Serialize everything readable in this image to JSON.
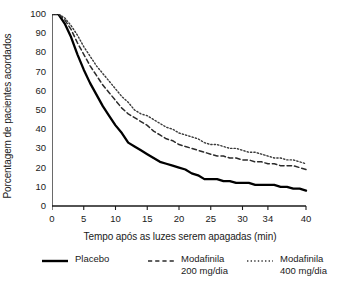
{
  "chart_data": {
    "type": "line",
    "title": "",
    "xlabel": "Tempo após as luzes serem apagadas (min)",
    "ylabel": "Porcentagem de pacientes acordados",
    "xlim": [
      0,
      40
    ],
    "ylim": [
      0,
      100
    ],
    "grid": false,
    "legend_position": "bottom",
    "x_ticks": [
      "0",
      "5",
      "10",
      "15",
      "20",
      "25",
      "30",
      "34",
      "40"
    ],
    "x_tick_values": [
      0,
      5,
      10,
      15,
      20,
      25,
      30,
      34,
      40
    ],
    "y_ticks": [
      "0",
      "10",
      "20",
      "30",
      "40",
      "50",
      "60",
      "70",
      "80",
      "90",
      "100"
    ],
    "y_tick_values": [
      0,
      10,
      20,
      30,
      40,
      50,
      60,
      70,
      80,
      90,
      100
    ],
    "x": [
      0,
      1,
      2,
      3,
      4,
      5,
      6,
      7,
      8,
      9,
      10,
      11,
      12,
      13,
      14,
      15,
      16,
      17,
      18,
      19,
      20,
      21,
      22,
      23,
      24,
      25,
      26,
      27,
      28,
      29,
      30,
      31,
      32,
      33,
      34,
      35,
      36,
      37,
      38,
      39,
      40
    ],
    "series": [
      {
        "name": "Placebo",
        "style": "solid",
        "color": "#000000",
        "values": [
          100,
          100,
          95,
          88,
          79,
          71,
          64,
          58,
          52,
          47,
          42,
          38,
          33,
          31,
          29,
          27,
          25,
          23,
          22,
          21,
          20,
          19,
          17,
          16,
          14,
          14,
          14,
          13,
          13,
          12,
          12,
          12,
          11,
          11,
          11,
          11,
          10,
          10,
          9,
          9,
          8
        ]
      },
      {
        "name": "Modafinila 200 mg/dia",
        "style": "dashed",
        "color": "#2b2b2b",
        "values": [
          100,
          100,
          97,
          92,
          85,
          79,
          73,
          68,
          63,
          59,
          55,
          51,
          48,
          46,
          44,
          42,
          39,
          37,
          35,
          34,
          32,
          31,
          30,
          29,
          28,
          27,
          26,
          26,
          25,
          25,
          24,
          24,
          23,
          23,
          22,
          22,
          21,
          21,
          21,
          20,
          19
        ]
      },
      {
        "name": "Modafinila 400 mg/dia",
        "style": "dotted",
        "color": "#3a3a3a",
        "values": [
          100,
          100,
          98,
          94,
          89,
          83,
          78,
          73,
          69,
          65,
          61,
          57,
          54,
          50,
          48,
          47,
          45,
          43,
          41,
          40,
          38,
          37,
          36,
          35,
          33,
          32,
          32,
          31,
          30,
          30,
          29,
          28,
          28,
          27,
          26,
          25,
          25,
          24,
          24,
          23,
          22
        ]
      }
    ]
  },
  "legend": {
    "entries": [
      {
        "label_line1": "Placebo",
        "label_line2": "",
        "style": "solid"
      },
      {
        "label_line1": "Modafinila",
        "label_line2": "200 mg/dia",
        "style": "dashed"
      },
      {
        "label_line1": "Modafinila",
        "label_line2": "400 mg/dia",
        "style": "dotted"
      }
    ]
  }
}
